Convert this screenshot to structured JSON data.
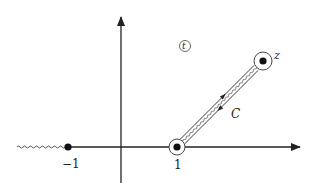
{
  "diagram": {
    "plane_label": "t",
    "points": {
      "minus_one": {
        "label": "−1"
      },
      "one": {
        "label": "1"
      },
      "z": {
        "label": "z"
      }
    },
    "contour_label": "C",
    "branch_cuts": [
      {
        "from": "−∞",
        "to": "−1"
      },
      {
        "from": "1",
        "to": "z"
      }
    ],
    "colors": {
      "ink": "#222222",
      "background": "#ffffff"
    }
  }
}
